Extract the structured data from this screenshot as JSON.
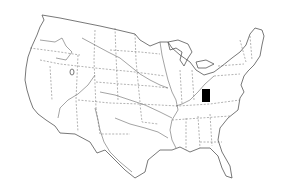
{
  "map": {
    "subject": "Contiguous United States outline map with state boundaries and major rivers",
    "background_color": "#ffffff",
    "line_color": "#555555",
    "state_boundary_style": "dashed",
    "marker": {
      "shape": "rectangle",
      "color": "#000000",
      "region": "West Virginia / eastern Kentucky",
      "x": 202,
      "y": 89,
      "width": 8,
      "height": 13
    }
  }
}
